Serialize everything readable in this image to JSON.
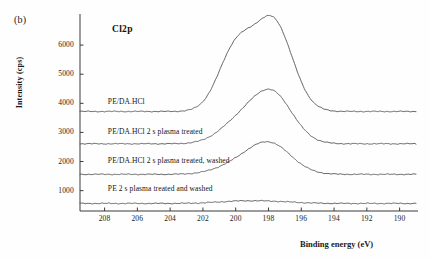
{
  "figure": {
    "panel_label": "(b)",
    "title": "Cl2p",
    "xlabel": "Binding energy (eV)",
    "ylabel": "Intensity (cps)"
  },
  "chart_data": {
    "type": "line",
    "title": "Cl2p",
    "xlabel": "Binding energy (eV)",
    "ylabel": "Intensity (cps)",
    "xlim": [
      209.5,
      189.0
    ],
    "ylim": [
      300,
      7000
    ],
    "x_ticks": [
      208,
      206,
      204,
      202,
      200,
      198,
      196,
      194,
      192,
      190
    ],
    "y_ticks": [
      1000,
      2000,
      3000,
      4000,
      5000,
      6000
    ],
    "grid": false,
    "legend": "inline-curve-labels",
    "x_inverted": true,
    "series": [
      {
        "name": "PE/DA.HCl",
        "label": "PE/DA.HCl",
        "label_x": 207.8,
        "label_y": 4050,
        "baseline": 3720,
        "peaks": [
          {
            "center": 200.0,
            "height": 2100,
            "width": 1.05
          },
          {
            "center": 197.7,
            "height": 3050,
            "width": 1.15
          }
        ],
        "peak_max": 6780,
        "peak_max_x": 197.6
      },
      {
        "name": "PE/DA.HCl 2 s plasma treated",
        "label": "PE/DA.HCl 2 s plasma treated",
        "label_x": 207.8,
        "label_y": 3000,
        "baseline": 2610,
        "peaks": [
          {
            "center": 199.9,
            "height": 620,
            "width": 1.2
          },
          {
            "center": 197.8,
            "height": 1720,
            "width": 1.25
          }
        ],
        "peak_max": 4330,
        "peak_max_x": 197.8
      },
      {
        "name": "PE/DA.HCl 2 s plasma treated, washed",
        "label": "PE/DA.HCl 2 s plasma treated, washed",
        "label_x": 207.8,
        "label_y": 2030,
        "baseline": 1560,
        "peaks": [
          {
            "center": 199.9,
            "height": 300,
            "width": 1.3
          },
          {
            "center": 197.9,
            "height": 1020,
            "width": 1.3
          }
        ],
        "peak_max": 2580,
        "peak_max_x": 197.9
      },
      {
        "name": "PE 2 s plasma treated and washed",
        "label": "PE 2 s plasma treated and washed",
        "label_x": 207.8,
        "label_y": 1050,
        "baseline": 560,
        "peaks": [
          {
            "center": 199.8,
            "height": 70,
            "width": 1.4
          },
          {
            "center": 197.6,
            "height": 55,
            "width": 1.4
          }
        ],
        "peak_max": 630,
        "peak_max_x": 199.8
      }
    ]
  }
}
